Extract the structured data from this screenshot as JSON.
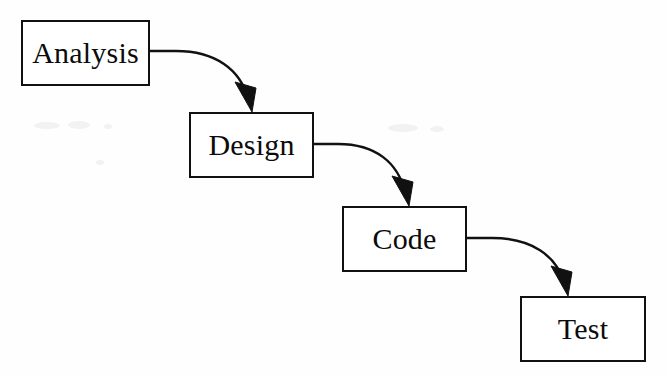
{
  "diagram": {
    "type": "flow",
    "background_color": "#fefefe",
    "line_color": "#111111",
    "text_color": "#0b0b0b",
    "stages": [
      {
        "id": "analysis",
        "label": "Analysis",
        "x": 21,
        "y": 20,
        "width": 129,
        "height": 66
      },
      {
        "id": "design",
        "label": "Design",
        "x": 189,
        "y": 112,
        "width": 125,
        "height": 66
      },
      {
        "id": "code",
        "label": "Code",
        "x": 342,
        "y": 206,
        "width": 125,
        "height": 66
      },
      {
        "id": "test",
        "label": "Test",
        "x": 520,
        "y": 296,
        "width": 126,
        "height": 66
      }
    ],
    "connectors": [
      {
        "id": "analysis-to-design",
        "from": "analysis",
        "to": "design",
        "from_x": 150,
        "from_y": 51,
        "to_x": 252,
        "to_y": 112
      },
      {
        "id": "design-to-code",
        "from": "design",
        "to": "code",
        "from_x": 314,
        "from_y": 144,
        "to_x": 409,
        "to_y": 206
      },
      {
        "id": "code-to-test",
        "from": "code",
        "to": "test",
        "from_x": 467,
        "from_y": 238,
        "to_x": 568,
        "to_y": 296
      }
    ]
  }
}
